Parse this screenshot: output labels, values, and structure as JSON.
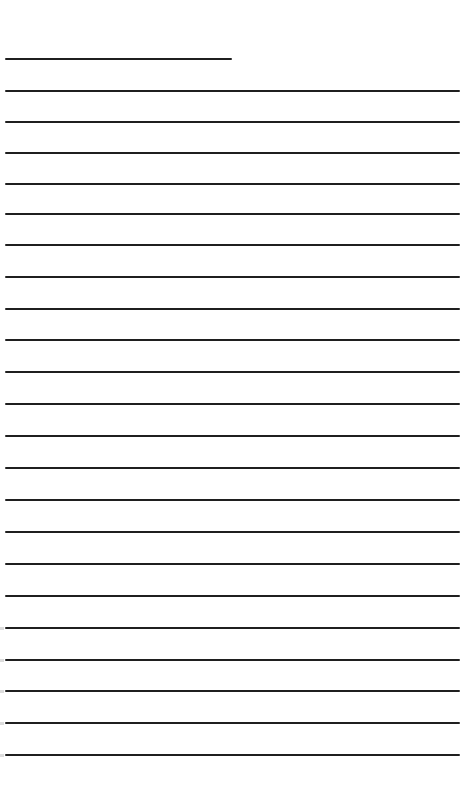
{
  "document": {
    "type": "lined-paper",
    "background": "#ffffff",
    "line_color": "#1f1f1f",
    "header_line": {
      "y": 59,
      "x_start": 5,
      "x_end": 232
    },
    "ruled_lines": {
      "count": 22,
      "x_start": 5,
      "x_end": 460,
      "y_positions": [
        91,
        122,
        153,
        184,
        214,
        245,
        277,
        309,
        340,
        372,
        404,
        436,
        468,
        500,
        532,
        564,
        596,
        628,
        660,
        691,
        723,
        755
      ]
    }
  }
}
